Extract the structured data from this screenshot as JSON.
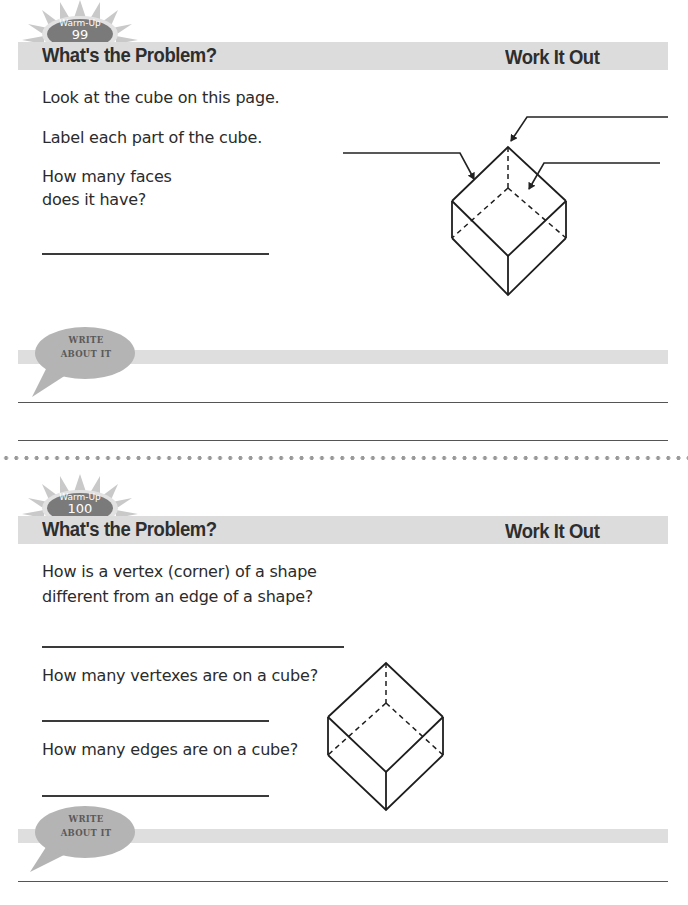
{
  "warmups": [
    {
      "badge": {
        "label": "Warm-Up",
        "number": "99"
      },
      "header": {
        "title": "What's the Problem?",
        "work_title": "Work It Out"
      },
      "questions": [
        {
          "text": "Look at the cube on this page."
        },
        {
          "text": "Label each part of the cube."
        },
        {
          "text_lines": [
            "How many faces",
            "does it have?"
          ]
        }
      ],
      "figure": {
        "name": "cube-diagram-with-label-arrows",
        "label_arrows": 3
      },
      "write_about_it": {
        "line1": "WRITE",
        "line2": "ABOUT IT"
      }
    },
    {
      "badge": {
        "label": "Warm-Up",
        "number": "100"
      },
      "header": {
        "title": "What's the Problem?",
        "work_title": "Work It Out"
      },
      "questions": [
        {
          "text_lines": [
            "How is a vertex (corner) of a shape",
            "different from an edge of a shape?"
          ]
        },
        {
          "text": "How many vertexes are on a cube?"
        },
        {
          "text": "How many edges are on a cube?"
        }
      ],
      "figure": {
        "name": "cube-diagram"
      },
      "write_about_it": {
        "line1": "WRITE",
        "line2": "ABOUT IT"
      }
    }
  ],
  "colors": {
    "header_band": "#dcdcdc",
    "badge_oval": "#7a7a7a",
    "sunburst": "#c8c8c8",
    "bubble": "#b4b4b4",
    "ink": "#2b2b2b"
  }
}
